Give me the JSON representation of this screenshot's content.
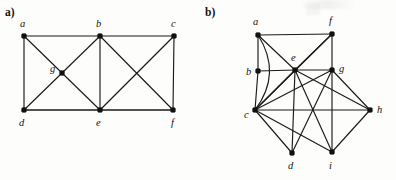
{
  "figure": {
    "background_color": "#fdfdfb",
    "ink_color": "#1c1a18",
    "width": 396,
    "height": 180
  },
  "panels": [
    {
      "id": "a",
      "label": "a)",
      "graph": {
        "type": "undirected-graph",
        "vertex_count": 7,
        "edge_count": 14,
        "vertices": [
          {
            "id": "a",
            "label": "a",
            "x": 24,
            "y": 36,
            "label_x": 20,
            "label_y": 27
          },
          {
            "id": "b",
            "label": "b",
            "x": 100,
            "y": 36,
            "label_x": 96,
            "label_y": 27
          },
          {
            "id": "c",
            "label": "c",
            "x": 174,
            "y": 36,
            "label_x": 171,
            "label_y": 27
          },
          {
            "id": "g",
            "label": "g",
            "x": 62,
            "y": 73,
            "label_x": 50,
            "label_y": 72
          },
          {
            "id": "d",
            "label": "d",
            "x": 24,
            "y": 110,
            "label_x": 19,
            "label_y": 126
          },
          {
            "id": "e",
            "label": "e",
            "x": 100,
            "y": 110,
            "label_x": 96,
            "label_y": 126
          },
          {
            "id": "f",
            "label": "f",
            "x": 173,
            "y": 110,
            "label_x": 171,
            "label_y": 126
          }
        ],
        "edges": [
          {
            "from": "a",
            "to": "b"
          },
          {
            "from": "b",
            "to": "c"
          },
          {
            "from": "a",
            "to": "d"
          },
          {
            "from": "d",
            "to": "e"
          },
          {
            "from": "e",
            "to": "f"
          },
          {
            "from": "c",
            "to": "f"
          },
          {
            "from": "b",
            "to": "e"
          },
          {
            "from": "a",
            "to": "g"
          },
          {
            "from": "g",
            "to": "e"
          },
          {
            "from": "d",
            "to": "g"
          },
          {
            "from": "g",
            "to": "b"
          },
          {
            "from": "b",
            "to": "f"
          },
          {
            "from": "c",
            "to": "e"
          },
          {
            "from": "d",
            "to": "f"
          }
        ]
      }
    },
    {
      "id": "b",
      "label": "b)",
      "graph": {
        "type": "undirected-graph",
        "vertex_count": 9,
        "edge_count": 22,
        "vertices": [
          {
            "id": "a",
            "label": "a",
            "x": 60,
            "y": 35,
            "label_x": 55,
            "label_y": 25
          },
          {
            "id": "f",
            "label": "f",
            "x": 134,
            "y": 34,
            "label_x": 131,
            "label_y": 24
          },
          {
            "id": "b",
            "label": "b",
            "x": 60,
            "y": 71,
            "label_x": 48,
            "label_y": 75
          },
          {
            "id": "e",
            "label": "e",
            "x": 97,
            "y": 70,
            "label_x": 93,
            "label_y": 61
          },
          {
            "id": "g",
            "label": "g",
            "x": 134,
            "y": 70,
            "label_x": 141,
            "label_y": 72
          },
          {
            "id": "c",
            "label": "c",
            "x": 57,
            "y": 110,
            "label_x": 46,
            "label_y": 118
          },
          {
            "id": "h",
            "label": "h",
            "x": 172,
            "y": 110,
            "label_x": 179,
            "label_y": 113
          },
          {
            "id": "d",
            "label": "d",
            "x": 94,
            "y": 153,
            "label_x": 90,
            "label_y": 169
          },
          {
            "id": "i",
            "label": "i",
            "x": 134,
            "y": 152,
            "label_x": 131,
            "label_y": 169
          }
        ],
        "edges": [
          {
            "from": "a",
            "to": "f",
            "shape": "line"
          },
          {
            "from": "a",
            "to": "b",
            "shape": "line"
          },
          {
            "from": "b",
            "to": "c",
            "shape": "line"
          },
          {
            "from": "a",
            "to": "c",
            "shape": "arc"
          },
          {
            "from": "a",
            "to": "e",
            "shape": "line"
          },
          {
            "from": "f",
            "to": "g",
            "shape": "line"
          },
          {
            "from": "f",
            "to": "e",
            "shape": "line"
          },
          {
            "from": "f",
            "to": "c",
            "shape": "line"
          },
          {
            "from": "b",
            "to": "e",
            "shape": "line"
          },
          {
            "from": "e",
            "to": "g",
            "shape": "line"
          },
          {
            "from": "e",
            "to": "c",
            "shape": "line"
          },
          {
            "from": "e",
            "to": "d",
            "shape": "line"
          },
          {
            "from": "e",
            "to": "i",
            "shape": "line"
          },
          {
            "from": "e",
            "to": "h",
            "shape": "line"
          },
          {
            "from": "g",
            "to": "c",
            "shape": "line"
          },
          {
            "from": "g",
            "to": "d",
            "shape": "line"
          },
          {
            "from": "g",
            "to": "i",
            "shape": "line"
          },
          {
            "from": "g",
            "to": "h",
            "shape": "line"
          },
          {
            "from": "c",
            "to": "h",
            "shape": "line"
          },
          {
            "from": "c",
            "to": "d",
            "shape": "line"
          },
          {
            "from": "c",
            "to": "i",
            "shape": "line"
          },
          {
            "from": "i",
            "to": "h",
            "shape": "line"
          }
        ]
      }
    }
  ]
}
